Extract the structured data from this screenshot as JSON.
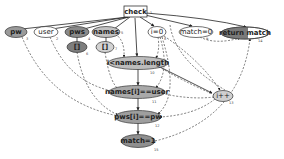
{
  "diagram": {
    "type": "program dependence graph",
    "colors": {
      "dark": "#8a8a8a",
      "mid": "#a8a8a8",
      "light": "#d2d2d2",
      "white": "#ffffff",
      "stroke": "#333333",
      "edge": "#333333"
    },
    "nodes": {
      "check": {
        "label": "check",
        "num": "1"
      },
      "pw": {
        "label": "pw",
        "num": "3"
      },
      "user": {
        "label": "user",
        "num": "2"
      },
      "pws": {
        "label": "pws",
        "num": "4"
      },
      "names": {
        "label": "names",
        "num": "5"
      },
      "pws_arr": {
        "label": "[]",
        "num": "6"
      },
      "names_arr": {
        "label": "[]",
        "num": "7"
      },
      "i0": {
        "label": "i=0",
        "num": "8"
      },
      "match0": {
        "label": "match=0",
        "num": "9"
      },
      "return_match": {
        "label": "return match",
        "num": "14"
      },
      "loop_cond": {
        "label": "i<names.length",
        "num": "10"
      },
      "names_eq": {
        "label": "names[i]==user",
        "num": "11"
      },
      "inc": {
        "label": "i++",
        "num": "13"
      },
      "pws_eq": {
        "label": "pws[i]==pw",
        "num": "12"
      },
      "match1": {
        "label": "match=1",
        "num": "15"
      }
    },
    "edge_types": [
      "control dependence (solid)",
      "data dependence (dashed)"
    ]
  }
}
